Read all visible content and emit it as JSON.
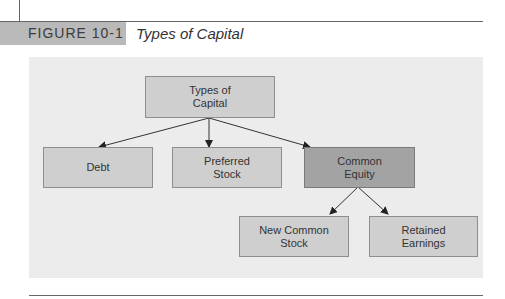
{
  "figure": {
    "label": "FIGURE 10-1",
    "title": "Types of Capital"
  },
  "diagram": {
    "root": {
      "label": "Types of Capital",
      "line1": "Types of",
      "line2": "Capital"
    },
    "level1": [
      {
        "label": "Debt",
        "line1": "Debt",
        "line2": ""
      },
      {
        "label": "Preferred Stock",
        "line1": "Preferred",
        "line2": "Stock"
      },
      {
        "label": "Common Equity",
        "line1": "Common",
        "line2": "Equity",
        "highlighted": true
      }
    ],
    "level2": [
      {
        "label": "New Common Stock",
        "line1": "New Common",
        "line2": "Stock",
        "parent": "Common Equity"
      },
      {
        "label": "Retained Earnings",
        "line1": "Retained",
        "line2": "Earnings",
        "parent": "Common Equity"
      }
    ],
    "colors": {
      "box": "#cfcfcf",
      "highlight_box": "#a3a3a3",
      "panel": "#ececec",
      "header_tag": "#b9b9b9"
    }
  }
}
